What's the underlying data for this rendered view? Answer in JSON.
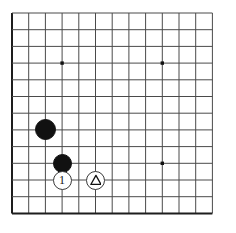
{
  "figure": {
    "kind": "go-board-diagram",
    "title": "",
    "caption": "",
    "board": {
      "origin_x": 12,
      "origin_y": 13,
      "spacing": 16.7,
      "cols": 13,
      "rows": 13,
      "line_color": "#4a4a4a",
      "edge_color": "#1d1d1d",
      "background_color": "#ffffff",
      "edges": {
        "left": true,
        "top": false,
        "right": false,
        "bottom": true
      }
    },
    "star_points": [
      {
        "col": 3,
        "row": 3
      },
      {
        "col": 9,
        "row": 3
      },
      {
        "col": 9,
        "row": 9
      }
    ],
    "stones": [
      {
        "id": "black-a",
        "color": "black",
        "col": 2,
        "row": 7,
        "radius": 10.5,
        "marker": "none",
        "marker_label": ""
      },
      {
        "id": "black-b",
        "color": "black",
        "col": 3,
        "row": 9,
        "radius": 9.5,
        "marker": "none",
        "marker_label": ""
      },
      {
        "id": "white-move-1",
        "color": "white",
        "col": 3,
        "row": 10,
        "radius": 9.5,
        "marker": "label",
        "marker_label": "1"
      },
      {
        "id": "white-triangle",
        "color": "white",
        "col": 5,
        "row": 10,
        "radius": 9.5,
        "marker": "triangle",
        "marker_label": ""
      }
    ],
    "colors": {
      "black_stone": "#111111",
      "white_stone": "#ffffff",
      "white_stone_outline": "#3a3a3a",
      "marker_ink": "#111111",
      "grid": "#4a4a4a",
      "star": "#111111"
    }
  }
}
